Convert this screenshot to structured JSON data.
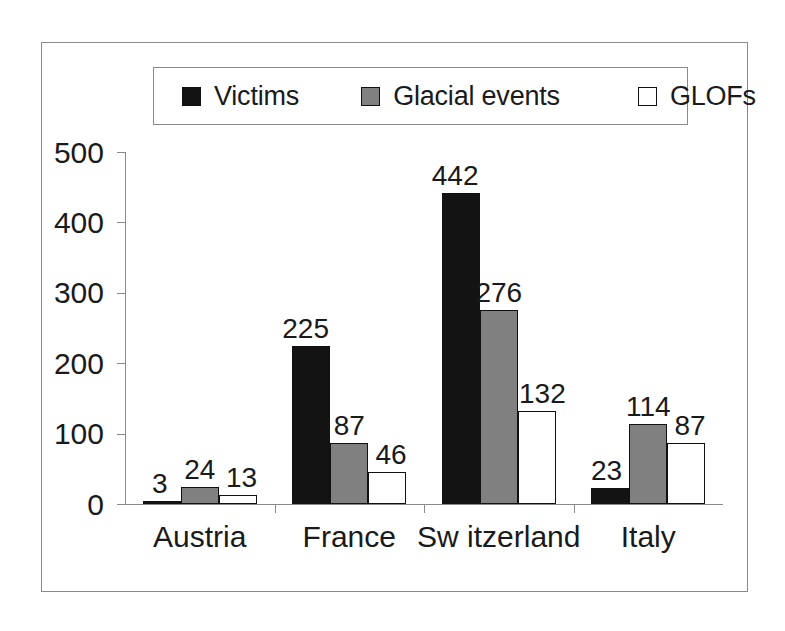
{
  "chart_data": {
    "type": "bar",
    "title": "",
    "subtitle": "",
    "xlabel": "",
    "ylabel": "",
    "categories": [
      "Austria",
      "France",
      "Sw itzerland",
      "Italy"
    ],
    "series": [
      {
        "name": "Victims",
        "values": [
          3,
          225,
          442,
          23
        ],
        "color": "#131313",
        "swatch": "black-filled-square"
      },
      {
        "name": "Glacial events",
        "values": [
          24,
          87,
          276,
          114
        ],
        "color": "#808080",
        "swatch": "gray-filled-square"
      },
      {
        "name": "GLOFs",
        "values": [
          13,
          46,
          132,
          87
        ],
        "color": "#ffffff",
        "swatch": "white-open-square"
      }
    ],
    "ylim": [
      0,
      500
    ],
    "yticks": [
      0,
      100,
      200,
      300,
      400,
      500
    ],
    "ytick_labels": [
      "0",
      "100",
      "200",
      "300",
      "400",
      "500"
    ],
    "grid": false,
    "data_labels": true,
    "legend_position": "top",
    "frame": true
  },
  "colors": {
    "victims": "#131313",
    "glacial_events": "#808080",
    "glofs": "#ffffff",
    "axis": "#8a8a8a",
    "outline": "#111111",
    "background": "#ffffff",
    "text": "#1a1a1a"
  }
}
